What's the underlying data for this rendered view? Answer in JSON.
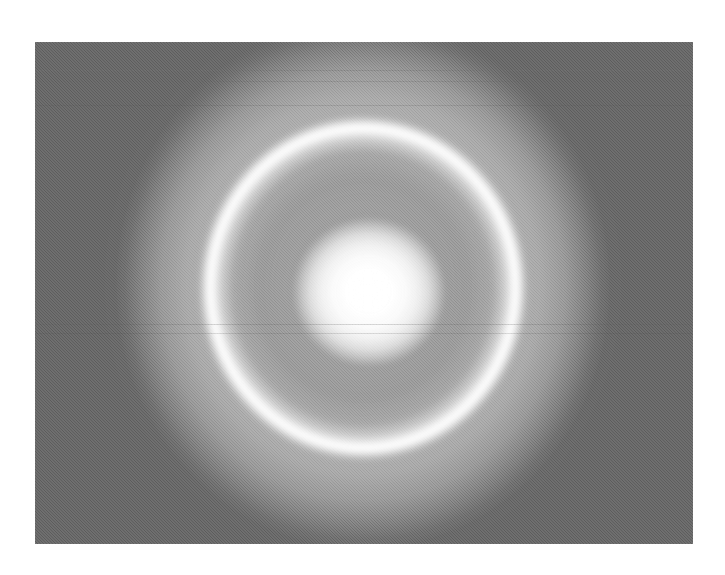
{
  "document": {
    "title": "Ring Structure Intensity Image",
    "kind": "grayscale-scientific-image",
    "background_color": "#ffffff",
    "plate_color": "#000000"
  },
  "frame": {
    "x": 35,
    "y": 42,
    "width": 658,
    "height": 502,
    "label": "image-plate"
  },
  "chart_data": {
    "type": "heatmap",
    "subtitle": "",
    "xlabel": "",
    "ylabel": "",
    "colormap": "grayscale",
    "grid": false,
    "legend": "none",
    "axis_visible": false,
    "tick_labels": [],
    "annotations": [],
    "xlim": [
      0,
      658
    ],
    "ylim": [
      0,
      502
    ],
    "value_range": [
      0,
      255
    ],
    "features": [
      {
        "name": "background",
        "shape": "field",
        "center_x": 363,
        "center_y": 288,
        "intensity": 6,
        "note": "black detector background with faint horizontal readout lines"
      },
      {
        "name": "outer-halo",
        "shape": "ellipse",
        "center_x": 363,
        "center_y": 286,
        "radius_x": 252,
        "radius_y": 268,
        "intensity_peak": 150,
        "intensity_edge": 10,
        "note": "broad soft diffuse disk fading to background"
      },
      {
        "name": "ring-interior-plateau",
        "shape": "ellipse",
        "center_x": 363,
        "center_y": 288,
        "radius_x": 150,
        "radius_y": 158,
        "intensity_peak": 178,
        "note": "slightly brighter plateau enclosed by the annulus"
      },
      {
        "name": "bright-annulus",
        "shape": "annulus",
        "center_x": 363,
        "center_y": 288,
        "radius_x": 151,
        "radius_y": 157,
        "ring_width": 16,
        "intensity_peak": 255,
        "note": "narrow saturated ring, peak brightness of the frame"
      },
      {
        "name": "central-core",
        "shape": "ellipse",
        "center_x": 369,
        "center_y": 292,
        "radius_x": 78,
        "radius_y": 76,
        "intensity_peak": 255,
        "intensity_edge": 190,
        "note": "saturated central blob with soft Gaussian falloff"
      }
    ],
    "radial_profile": {
      "radius": [
        0,
        20,
        40,
        60,
        75,
        90,
        110,
        130,
        145,
        152,
        157,
        165,
        180,
        200,
        225,
        250,
        270
      ],
      "intensity": [
        255,
        253,
        246,
        226,
        196,
        180,
        178,
        180,
        214,
        250,
        255,
        218,
        168,
        150,
        122,
        52,
        8
      ]
    }
  },
  "artifacts": {
    "scanlines": [
      {
        "y": 70,
        "opacity": 0.3,
        "color": "#6e6e6e"
      },
      {
        "y": 81,
        "opacity": 0.26,
        "color": "#636363"
      },
      {
        "y": 105,
        "opacity": 0.2,
        "color": "#555555"
      },
      {
        "y": 324,
        "opacity": 0.24,
        "color": "#5e5e5e"
      },
      {
        "y": 333,
        "opacity": 0.18,
        "color": "#4d4d4d"
      }
    ],
    "grain_opacity": 0.16,
    "noise_type": "film-grain-dither"
  }
}
